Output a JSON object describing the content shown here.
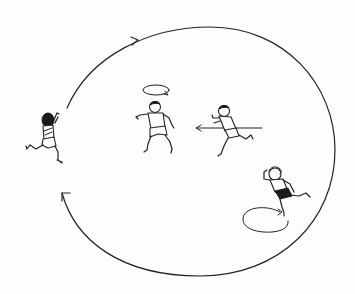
{
  "diagram": {
    "description": "Line drawing of a movement game: four children running, one large clockwise circuit path with a gap on the left, two small loop paths and a straight-line dash arrow",
    "colors": {
      "ink": "#222222",
      "background": "#fdfdfd"
    },
    "main_path": {
      "shape": "ellipse-open",
      "direction": "clockwise",
      "center": [
        200,
        151
      ],
      "rx": 135,
      "ry": 124,
      "gap_side": "left",
      "arrows": [
        {
          "position": [
            136,
            41
          ],
          "direction": "right"
        },
        {
          "position": [
            62,
            194
          ],
          "direction": "up-left"
        }
      ]
    },
    "figures": [
      {
        "id": "runner-left",
        "label": "Child running along the circuit (dark hair, back view)",
        "position": [
          47,
          135
        ],
        "action": "running-circuit"
      },
      {
        "id": "spinner-center",
        "label": "Child turning in place",
        "position": [
          155,
          118
        ],
        "action": "spin",
        "loop_above": true
      },
      {
        "id": "dasher-right",
        "label": "Child sprinting leftward along a straight line",
        "position": [
          230,
          130
        ],
        "action": "straight-dash",
        "arrow_direction": "left"
      },
      {
        "id": "looper-bottom-right",
        "label": "Child running a small loop (dark shorts, curly hair)",
        "position": [
          282,
          190
        ],
        "action": "small-loop",
        "loop_below": true
      }
    ],
    "small_loops": [
      {
        "id": "loop-center",
        "center": [
          155,
          90
        ],
        "rx": 13,
        "ry": 5,
        "arrow": "clockwise"
      },
      {
        "id": "loop-bottom-right",
        "center": [
          262,
          224
        ],
        "rx": 19,
        "ry": 11,
        "arrow": "clockwise"
      }
    ],
    "dash_line": {
      "from": [
        262,
        128
      ],
      "to": [
        197,
        128
      ],
      "arrowhead": "left"
    }
  }
}
